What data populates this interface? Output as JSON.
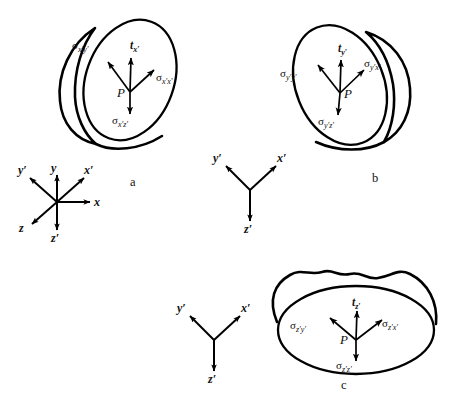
{
  "figure": {
    "background_color": "#ffffff",
    "stroke_color": "#000000",
    "width": 464,
    "height": 410
  },
  "panels": [
    {
      "id": "a",
      "letter": "a",
      "plane": "x'-plane",
      "point_label": "P",
      "traction": {
        "symbol": "t",
        "subscript": "x′",
        "direction": "up"
      },
      "stresses": [
        {
          "symbol": "σ",
          "subscript": "x′y′",
          "direction": "upper-left"
        },
        {
          "symbol": "σ",
          "subscript": "x′x′",
          "direction": "upper-right"
        },
        {
          "symbol": "σ",
          "subscript": "x′z′",
          "direction": "down"
        }
      ],
      "body_shape": "tilted-ellipse-cut-with-left-bulge"
    },
    {
      "id": "b",
      "letter": "b",
      "plane": "y'-plane",
      "point_label": "P",
      "traction": {
        "symbol": "t",
        "subscript": "y′",
        "direction": "up"
      },
      "stresses": [
        {
          "symbol": "σ",
          "subscript": "y′y′",
          "direction": "upper-left"
        },
        {
          "symbol": "σ",
          "subscript": "y′x′",
          "direction": "upper-right"
        },
        {
          "symbol": "σ",
          "subscript": "y′z′",
          "direction": "down"
        }
      ],
      "body_shape": "tilted-ellipse-cut-with-right-bulge"
    },
    {
      "id": "c",
      "letter": "c",
      "plane": "z'-plane",
      "point_label": "P",
      "traction": {
        "symbol": "t",
        "subscript": "z′",
        "direction": "up"
      },
      "stresses": [
        {
          "symbol": "σ",
          "subscript": "z′y′",
          "direction": "upper-left"
        },
        {
          "symbol": "σ",
          "subscript": "z′x′",
          "direction": "upper-right"
        },
        {
          "symbol": "σ",
          "subscript": "z′z′",
          "direction": "down"
        }
      ],
      "body_shape": "horizontal-ellipse-cut-with-wavy-top-bulge"
    }
  ],
  "axis_triads": [
    {
      "id": "triad-a",
      "type": "six-arrow",
      "axes": [
        {
          "label": "y′",
          "direction": "upper-left"
        },
        {
          "label": "y",
          "direction": "up"
        },
        {
          "label": "x′",
          "direction": "upper-right"
        },
        {
          "label": "x",
          "direction": "right"
        },
        {
          "label": "z",
          "direction": "lower-left"
        },
        {
          "label": "z′",
          "direction": "down"
        }
      ]
    },
    {
      "id": "triad-b",
      "type": "three-arrow",
      "axes": [
        {
          "label": "y′",
          "direction": "upper-left"
        },
        {
          "label": "x′",
          "direction": "upper-right"
        },
        {
          "label": "z′",
          "direction": "down"
        }
      ]
    },
    {
      "id": "triad-c",
      "type": "three-arrow",
      "axes": [
        {
          "label": "y′",
          "direction": "upper-left"
        },
        {
          "label": "x′",
          "direction": "upper-right"
        },
        {
          "label": "z′",
          "direction": "down"
        }
      ]
    }
  ],
  "labels": {
    "sigma_glyph": "σ",
    "traction_glyph": "t",
    "point": "P",
    "panel_a": "a",
    "panel_b": "b",
    "panel_c": "c",
    "a_sig_xy": "x′y′",
    "a_sig_xx": "x′x′",
    "a_sig_xz": "x′z′",
    "a_t": "x′",
    "b_sig_yy": "y′y′",
    "b_sig_yx": "y′x′",
    "b_sig_yz": "y′z′",
    "b_t": "y′",
    "c_sig_zy": "z′y′",
    "c_sig_zx": "z′x′",
    "c_sig_zz": "z′z′",
    "c_t": "z′",
    "ax_yp": "y′",
    "ax_y": "y",
    "ax_xp": "x′",
    "ax_x": "x",
    "ax_z": "z",
    "ax_zp": "z′"
  }
}
